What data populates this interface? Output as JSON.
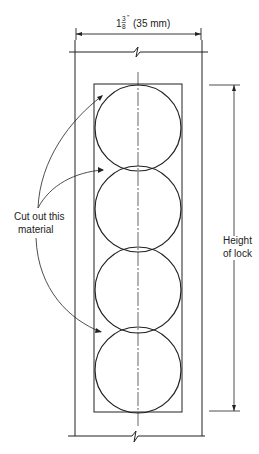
{
  "dimension_top": {
    "whole": "1",
    "numerator": "3",
    "denominator": "8",
    "unit_mark": "\"",
    "metric": "(35 mm)"
  },
  "callout_left": {
    "line1": "Cut out this",
    "line2": "material"
  },
  "dimension_right": {
    "line1": "Height",
    "line2": "of lock"
  },
  "colors": {
    "ink": "#222222",
    "background": "#ffffff"
  },
  "circles": [
    {
      "cx": 138,
      "cy": 128,
      "r": 43
    },
    {
      "cx": 138,
      "cy": 209,
      "r": 43
    },
    {
      "cx": 138,
      "cy": 290,
      "r": 43
    },
    {
      "cx": 138,
      "cy": 370,
      "r": 43
    }
  ]
}
